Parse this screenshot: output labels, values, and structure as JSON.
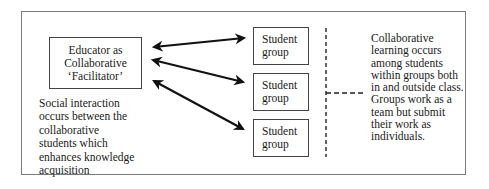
{
  "diagram": {
    "educator_box": {
      "lines": [
        "Educator as",
        "Collaborative",
        "‘Facilitator’"
      ]
    },
    "student_groups": [
      {
        "label": "Student group"
      },
      {
        "label": "Student group"
      },
      {
        "label": "Student group"
      }
    ],
    "left_note": "Social interaction occurs between the collaborative students which enhances knowledge acquisition",
    "right_note": "Collaborative learning occurs among students within groups both in and outside class. Groups work as a team but submit their work as individuals.",
    "connectors": [
      {
        "from": "educator",
        "to": "student-group-1",
        "type": "double-arrow"
      },
      {
        "from": "educator",
        "to": "student-group-2",
        "type": "double-arrow"
      },
      {
        "from": "educator",
        "to": "student-group-3",
        "type": "double-arrow"
      },
      {
        "from": "student-groups",
        "to": "right-note",
        "type": "dashed-bracket"
      }
    ],
    "colors": {
      "frame": "#7a7a7a",
      "box_border": "#444444",
      "arrow": "#111111",
      "text": "#1a1a1a"
    }
  }
}
